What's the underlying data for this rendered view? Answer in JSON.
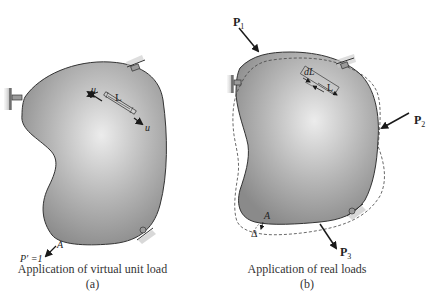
{
  "figure": {
    "panel_a": {
      "caption": "Application of virtual unit load",
      "sub_label": "(a)",
      "labels": {
        "u_top": "u",
        "u_bottom": "u",
        "length": "L",
        "point": "A",
        "load": "P′ =1"
      }
    },
    "panel_b": {
      "caption": "Application of real loads",
      "sub_label": "(b)",
      "labels": {
        "P1": "P",
        "P1_sub": "1",
        "P2": "P",
        "P2_sub": "2",
        "P3": "P",
        "P3_sub": "3",
        "dL": "dL",
        "length": "L",
        "point": "A",
        "delta": "Δ"
      }
    },
    "colors": {
      "body_fill_light": "#e6e6e6",
      "body_fill_dark": "#8e8e8e",
      "outline": "#333333",
      "arrow": "#1a1a1a",
      "support": "#9a9a9a"
    }
  }
}
